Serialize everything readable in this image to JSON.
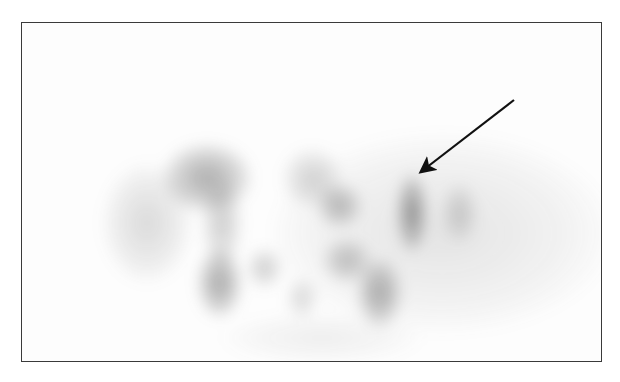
{
  "image": {
    "description": "Grayscale nuclear medicine scan (planar/SPECT-like) within a bordered frame, with an arrow pointing to a focal area of uptake on the right side",
    "frame": {
      "x": 21,
      "y": 22,
      "width": 581,
      "height": 340,
      "border_color": "#3a3a3a"
    },
    "arrow": {
      "from": [
        514,
        100
      ],
      "to": [
        416,
        176
      ],
      "color": "#111111"
    },
    "colors": {
      "background": "#ffffff",
      "uptake": "#555555"
    },
    "blobs": [
      {
        "x": 250,
        "y": 110,
        "w": 340,
        "h": 200,
        "o": 0.13
      },
      {
        "x": 80,
        "y": 140,
        "w": 90,
        "h": 120,
        "o": 0.18
      },
      {
        "x": 140,
        "y": 120,
        "w": 90,
        "h": 70,
        "o": 0.42
      },
      {
        "x": 180,
        "y": 155,
        "w": 40,
        "h": 90,
        "o": 0.25
      },
      {
        "x": 260,
        "y": 125,
        "w": 60,
        "h": 60,
        "o": 0.22
      },
      {
        "x": 295,
        "y": 160,
        "w": 45,
        "h": 45,
        "o": 0.35
      },
      {
        "x": 375,
        "y": 150,
        "w": 30,
        "h": 80,
        "o": 0.55
      },
      {
        "x": 420,
        "y": 160,
        "w": 35,
        "h": 60,
        "o": 0.22
      },
      {
        "x": 175,
        "y": 225,
        "w": 45,
        "h": 70,
        "o": 0.45
      },
      {
        "x": 225,
        "y": 225,
        "w": 35,
        "h": 40,
        "o": 0.25
      },
      {
        "x": 300,
        "y": 215,
        "w": 50,
        "h": 45,
        "o": 0.3
      },
      {
        "x": 335,
        "y": 235,
        "w": 45,
        "h": 70,
        "o": 0.42
      },
      {
        "x": 265,
        "y": 255,
        "w": 30,
        "h": 40,
        "o": 0.2
      },
      {
        "x": 200,
        "y": 290,
        "w": 200,
        "h": 50,
        "o": 0.08
      }
    ]
  }
}
